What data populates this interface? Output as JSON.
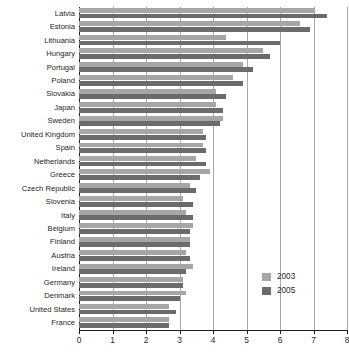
{
  "chart_data": {
    "type": "bar",
    "orientation": "horizontal",
    "title": "",
    "subtitle": "",
    "xlabel": "",
    "ylabel": "",
    "xlim": [
      0,
      8
    ],
    "xticks": [
      "0",
      "1",
      "2",
      "3",
      "4",
      "5",
      "6",
      "7",
      "8"
    ],
    "grid": true,
    "legend_position": "bottom-right-inside",
    "categories": [
      "Latvia",
      "Estonia",
      "Lithuania",
      "Hungary",
      "Portugal",
      "Poland",
      "Slovakia",
      "Japan",
      "Sweden",
      "United Kingdom",
      "Spain",
      "Netherlands",
      "Greece",
      "Czech Republic",
      "Slovenia",
      "Italy",
      "Belgium",
      "Finland",
      "Austria",
      "Ireland",
      "Germany",
      "Denmark",
      "United States",
      "France"
    ],
    "series": [
      {
        "name": "2003",
        "color": "#a6a6a6",
        "values": [
          7.0,
          6.6,
          4.4,
          5.5,
          4.9,
          4.6,
          4.1,
          4.1,
          4.3,
          3.7,
          3.7,
          3.5,
          3.9,
          3.3,
          3.1,
          3.2,
          3.4,
          3.3,
          3.2,
          3.4,
          3.1,
          3.2,
          2.7,
          2.7
        ]
      },
      {
        "name": "2005",
        "color": "#6b6b6b",
        "values": [
          7.4,
          6.9,
          6.0,
          5.7,
          5.2,
          4.9,
          4.4,
          4.3,
          4.2,
          3.8,
          3.8,
          3.8,
          3.6,
          3.5,
          3.4,
          3.4,
          3.3,
          3.3,
          3.3,
          3.2,
          3.1,
          3.0,
          2.9,
          2.7
        ]
      }
    ]
  },
  "legend": {
    "items": [
      {
        "label": "2003",
        "color": "#a6a6a6"
      },
      {
        "label": "2005",
        "color": "#6b6b6b"
      }
    ]
  }
}
